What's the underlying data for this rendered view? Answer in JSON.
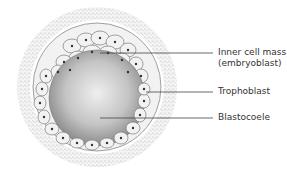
{
  "diagram": {
    "labels": [
      {
        "id": "inner-cell-mass",
        "line1": "Inner cell mass",
        "line2": "(embryoblast)"
      },
      {
        "id": "trophoblast",
        "line1": "Trophoblast"
      },
      {
        "id": "blastocoele",
        "line1": "Blastocoele"
      }
    ]
  },
  "colors": {
    "zona_speckle": "#c8c8c8",
    "cell_fill": "#f2f2f2",
    "cell_stroke": "#7a7a7a",
    "nucleus": "#333333",
    "cavity_center": "#ececec",
    "cavity_edge": "#8c8c8c",
    "leader_line": "#444444",
    "label_text": "#333333"
  }
}
